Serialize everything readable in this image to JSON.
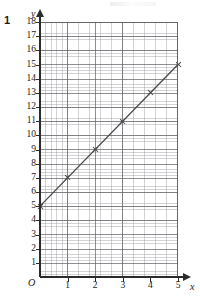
{
  "question": {
    "number": "1"
  },
  "chart_data": {
    "type": "line",
    "title": "",
    "xlabel": "x",
    "ylabel": "y",
    "origin_label": "O",
    "grid": true,
    "grid_style": "graph-paper",
    "minor_divisions_per_major_x": 5,
    "minor_divisions_per_major_y": 5,
    "legend_position": "none",
    "xlim": [
      0,
      5
    ],
    "ylim": [
      0,
      18
    ],
    "x_ticks": [
      "1",
      "2",
      "3",
      "4",
      "5"
    ],
    "x_tick_values": [
      1,
      2,
      3,
      4,
      5
    ],
    "y_ticks": [
      "18",
      "17",
      "16",
      "15",
      "14",
      "13",
      "12",
      "11",
      "10",
      "9",
      "8",
      "7",
      "6",
      "5",
      "4",
      "3",
      "2",
      "1"
    ],
    "y_tick_values": [
      18,
      17,
      16,
      15,
      14,
      13,
      12,
      11,
      10,
      9,
      8,
      7,
      6,
      5,
      4,
      3,
      2,
      1
    ],
    "series": [
      {
        "name": "line",
        "equation": "y = 2x + 5",
        "marker": "cross",
        "color": "#4a4a4a",
        "x": [
          0,
          1,
          2,
          3,
          4,
          5
        ],
        "values": [
          5,
          7,
          9,
          11,
          13,
          15
        ]
      }
    ]
  },
  "colors": {
    "axis": "#2b2b2b",
    "grid_major": "#5f5f64",
    "grid_minor": "#96969b",
    "line": "#4a4a4a",
    "text": "#1a1a1a",
    "background": "#ffffff"
  }
}
